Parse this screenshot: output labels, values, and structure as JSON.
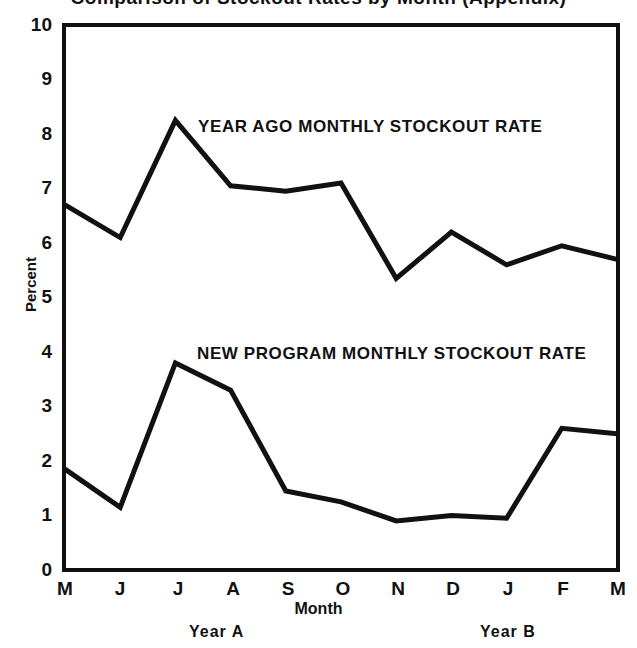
{
  "chart_data": {
    "type": "line",
    "title": "Comparison of Stockout Rates by Month (Appendix)",
    "xlabel": "Month",
    "ylabel": "Percent",
    "categories": [
      "M",
      "J",
      "J",
      "A",
      "S",
      "O",
      "N",
      "D",
      "J",
      "F",
      "M"
    ],
    "ylim": [
      0,
      10
    ],
    "yticks": [
      "0",
      "1",
      "2",
      "3",
      "4",
      "5",
      "6",
      "7",
      "8",
      "9",
      "10"
    ],
    "grid": false,
    "legend": "inline-annotations",
    "series": [
      {
        "name": "YEAR AGO MONTHLY STOCKOUT RATE",
        "values": [
          6.7,
          6.1,
          8.25,
          7.05,
          6.95,
          7.1,
          5.35,
          6.2,
          5.6,
          5.95,
          5.7
        ]
      },
      {
        "name": "NEW PROGRAM MONTHLY STOCKOUT RATE",
        "values": [
          1.85,
          1.15,
          3.8,
          3.3,
          1.45,
          1.25,
          0.9,
          1.0,
          0.95,
          2.6,
          2.5
        ]
      }
    ],
    "annotations": [
      {
        "text": "YEAR AGO MONTHLY STOCKOUT RATE"
      },
      {
        "text": "NEW PROGRAM MONTHLY STOCKOUT RATE"
      }
    ],
    "period_labels": [
      "Year A",
      "Year B"
    ],
    "line_color": "#111111",
    "background_color": "#ffffff"
  }
}
